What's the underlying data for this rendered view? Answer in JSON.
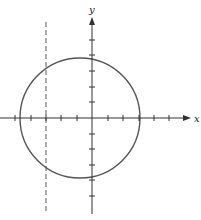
{
  "diagram": {
    "type": "coordinate-plane",
    "x_axis": {
      "label": "x",
      "y_px": 118,
      "x_start_px": 0,
      "x_end_px": 191,
      "tick_px": [
        15,
        31,
        46,
        61,
        77,
        108,
        123,
        139,
        154,
        169
      ],
      "arrow": "right"
    },
    "y_axis": {
      "label": "y",
      "x_px": 92,
      "y_start_px": 17,
      "y_end_px": 214,
      "tick_px": [
        40,
        55,
        71,
        87,
        102,
        134,
        149,
        165,
        180,
        196
      ],
      "arrow": "up"
    },
    "tick_spacing_px": 15.5,
    "tick_half_length_px": 3,
    "circle": {
      "cx_px": 80,
      "cy_px": 118,
      "r_px": 60,
      "stroke": "#555555"
    },
    "dashed_line": {
      "x_px": 46,
      "y_start_px": 22,
      "y_end_px": 214,
      "stroke": "#777777",
      "dash": "5,3"
    },
    "colors": {
      "axis": "#333333",
      "circle": "#555555",
      "dashed": "#777777",
      "background": "#ffffff"
    }
  }
}
